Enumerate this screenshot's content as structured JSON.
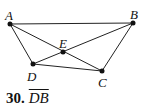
{
  "diagram": {
    "points": [
      {
        "label": "A",
        "x": 10,
        "y": 24
      },
      {
        "label": "B",
        "x": 133,
        "y": 23
      },
      {
        "label": "E",
        "x": 63,
        "y": 52
      },
      {
        "label": "D",
        "x": 33,
        "y": 64
      },
      {
        "label": "C",
        "x": 102,
        "y": 71
      }
    ],
    "segments": [
      [
        "A",
        "B"
      ],
      [
        "A",
        "D"
      ],
      [
        "A",
        "C"
      ],
      [
        "B",
        "D"
      ],
      [
        "B",
        "C"
      ],
      [
        "D",
        "C"
      ]
    ]
  },
  "labels": {
    "A": "A",
    "B": "B",
    "E": "E",
    "D": "D",
    "C": "C"
  },
  "caption": {
    "number": "30.",
    "segment": "DB"
  }
}
